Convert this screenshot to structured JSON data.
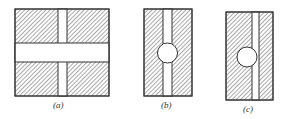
{
  "figure": {
    "panels": [
      {
        "id": "a",
        "label": "(a)",
        "description": "Square hatched block with a narrow vertical slot and a wide horizontal band crossing it"
      },
      {
        "id": "b",
        "label": "(b)",
        "description": "Rectangular hatched block with a centered vertical slot containing a circular hole"
      },
      {
        "id": "c",
        "label": "(c)",
        "description": "Rectangular hatched block with an off-center vertical slot and an adjacent circular hole"
      }
    ],
    "colors": {
      "stroke": "#333333",
      "hatch": "#555555",
      "background": "#ffffff"
    }
  }
}
